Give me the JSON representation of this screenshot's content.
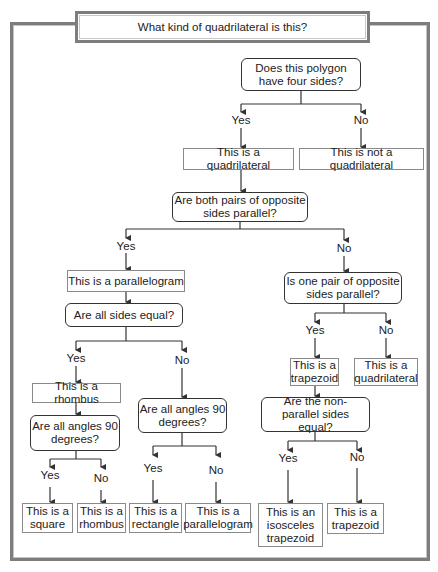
{
  "title": "What kind of quadrilateral is this?",
  "nodes": {
    "q_four_sides": "Does this polygon have four sides?",
    "r_quadrilateral": "This is a quadrilateral",
    "r_not_quadrilateral": "This is not a quadrilateral",
    "q_both_pairs_parallel": "Are both pairs of opposite sides parallel?",
    "r_parallelogram": "This is a parallelogram",
    "q_one_pair_parallel": "Is one pair of opposite sides parallel?",
    "q_all_sides_equal": "Are all sides equal?",
    "r_trapezoid": "This is a trapezoid",
    "r_quadrilateral_2": "This is a quadrilateral",
    "r_rhombus": "This is a rhombus",
    "q_angles_90_left": "Are all angles 90 degrees?",
    "q_angles_90_right": "Are all angles 90 degrees?",
    "q_nonparallel_equal": "Are the non-parallel sides equal?",
    "leaf_square": "This is a square",
    "leaf_rhombus": "This is a rhombus",
    "leaf_rectangle": "This is a rectangle",
    "leaf_parallelogram": "This is a parallelogram",
    "leaf_isosceles_trapezoid": "This is an isosceles trapezoid",
    "leaf_trapezoid": "This is a trapezoid"
  },
  "labels": {
    "yes": "Yes",
    "no": "No"
  },
  "colors": {
    "frame": "#7d7d7d",
    "line": "#333333",
    "rect_border": "#8a8a8a"
  }
}
